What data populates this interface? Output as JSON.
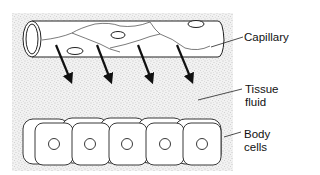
{
  "diagram": {
    "labels": {
      "capillary": "Capillary",
      "tissue_fluid_line1": "Tissue",
      "tissue_fluid_line2": "fluid",
      "body_cells_line1": "Body",
      "body_cells_line2": "cells"
    },
    "elements": {
      "capillary": {
        "shape": "tube",
        "orientation": "horizontal"
      },
      "arrows": {
        "count": 4,
        "direction": "down-right",
        "meaning": "fluid leaving capillary"
      },
      "body_cells": {
        "count": 5,
        "each_has_nucleus": true
      },
      "background": {
        "pattern": "stipple",
        "meaning": "tissue fluid"
      }
    },
    "colors": {
      "stroke": "#222222",
      "stipple": "#9a9a9a",
      "background": "#ffffff"
    }
  }
}
